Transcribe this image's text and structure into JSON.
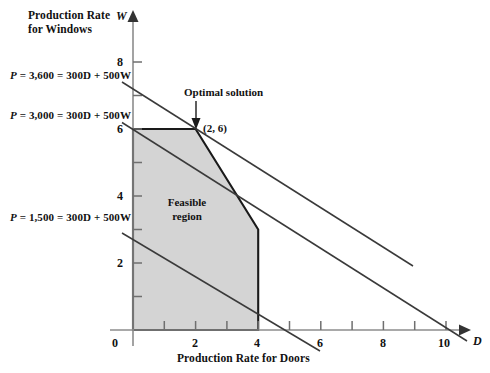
{
  "figure": {
    "axes": {
      "y_axis_title_line1": "Production Rate",
      "y_axis_title_line2": "for Windows",
      "y_axis_variable": "W",
      "x_axis_title": "Production Rate for Doors",
      "x_axis_variable": "D",
      "origin_label": "0",
      "x_tick_labels": [
        "2",
        "4",
        "6",
        "8",
        "10"
      ],
      "y_tick_labels": [
        "2",
        "4",
        "6",
        "8"
      ]
    },
    "annotations": {
      "optimal_solution_label": "Optimal solution",
      "optimal_point_label": "(2, 6)",
      "feasible_region_line1": "Feasible",
      "feasible_region_line2": "region",
      "objective_line_3600": "P = 3,600 = 300D + 500W",
      "objective_line_3000": "P = 3,000 = 300D + 500W",
      "objective_line_1500": "P = 1,500 = 300D + 500W"
    },
    "colors": {
      "feasible_fill": "#d4d4d4",
      "feasible_stroke": "#1a1a1a",
      "axis": "#808080",
      "objective_line": "#404040",
      "text": "#111111"
    }
  },
  "chart_data": {
    "type": "line",
    "title": "",
    "xlabel": "Production Rate for Doors",
    "ylabel": "Production Rate for Windows",
    "xlim": [
      0,
      10
    ],
    "ylim": [
      0,
      8
    ],
    "xticks": [
      0,
      2,
      4,
      6,
      8,
      10
    ],
    "yticks": [
      0,
      2,
      4,
      6,
      8
    ],
    "grid": false,
    "legend": "none",
    "feasible_region": {
      "label": "Feasible region",
      "vertices": [
        [
          0,
          0
        ],
        [
          0,
          6
        ],
        [
          2,
          6
        ],
        [
          4,
          3
        ],
        [
          4,
          0
        ]
      ],
      "fill": "#d4d4d4"
    },
    "optimal_solution": {
      "label": "Optimal solution",
      "point": [
        2,
        6
      ],
      "profit": 3600
    },
    "series": [
      {
        "name": "P = 1,500 = 300D + 500W",
        "slope": -0.6,
        "w_intercept": 3,
        "d_intercept": 5,
        "x": [
          0,
          6
        ],
        "y": [
          3,
          -0.6
        ]
      },
      {
        "name": "P = 3,000 = 300D + 500W",
        "slope": -0.6,
        "w_intercept": 6,
        "d_intercept": 10,
        "x": [
          0,
          10.8
        ],
        "y": [
          6,
          -0.48
        ]
      },
      {
        "name": "P = 3,600 = 300D + 500W",
        "slope": -0.6,
        "w_intercept": 7.2,
        "d_intercept": 12,
        "x": [
          0,
          8.7
        ],
        "y": [
          7.2,
          1.98
        ]
      }
    ],
    "constraints": [
      {
        "name": "D <= 4",
        "x": [
          4,
          4
        ],
        "y": [
          0,
          3
        ]
      },
      {
        "name": "3D + 2W <= 18",
        "x": [
          2,
          4
        ],
        "y": [
          6,
          3
        ]
      },
      {
        "name": "2W <= 12",
        "x": [
          0,
          2
        ],
        "y": [
          6,
          6
        ]
      }
    ]
  }
}
